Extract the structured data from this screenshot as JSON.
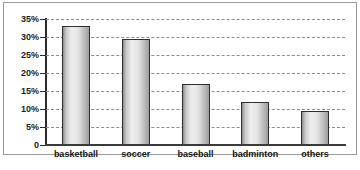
{
  "chart_data": {
    "type": "bar",
    "title": "",
    "xlabel": "",
    "ylabel": "",
    "categories": [
      "basketball",
      "soccer",
      "baseball",
      "badminton",
      "others"
    ],
    "values": [
      33,
      29.5,
      17,
      12,
      9.5
    ],
    "ylim": [
      0,
      35
    ],
    "ytick_labels": [
      "35%",
      "30%",
      "25%",
      "20%",
      "15%",
      "10%",
      "5%",
      "0"
    ],
    "ytick_values": [
      35,
      30,
      25,
      20,
      15,
      10,
      5,
      0
    ],
    "grid": true,
    "grid_style": "dashed",
    "legend": false,
    "bar_fill": "#e4e4e4",
    "bar_border": "#2e2e2e",
    "grid_color": "#8d8d8d",
    "axis_color": "#2b2b2b",
    "background": "#ffffff"
  }
}
